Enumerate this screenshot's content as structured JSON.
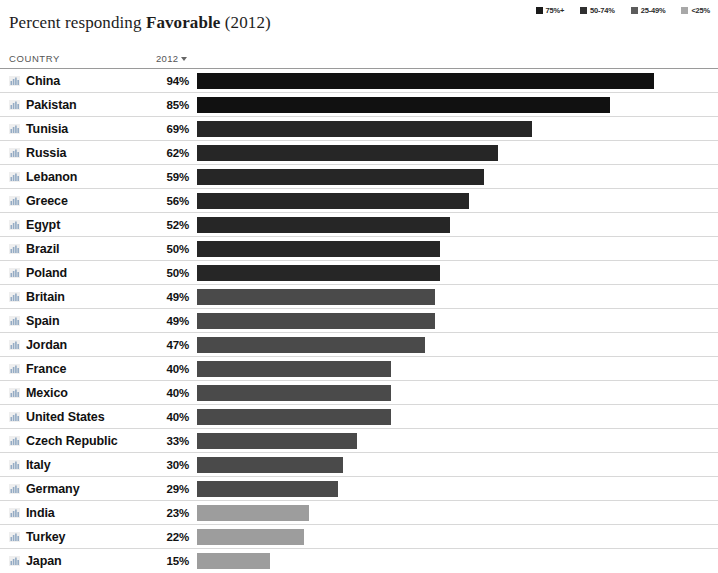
{
  "title": {
    "prefix": "Percent responding ",
    "strong": "Favorable",
    "suffix": " (2012)"
  },
  "legend": {
    "items": [
      {
        "label": "75%+",
        "color": "#1a1a1a",
        "icon": "legend-swatch-75-plus"
      },
      {
        "label": "50-74%",
        "color": "#303030",
        "icon": "legend-swatch-50-74"
      },
      {
        "label": "25-49%",
        "color": "#5c5c5c",
        "icon": "legend-swatch-25-49"
      },
      {
        "label": "<25%",
        "color": "#a8a8a8",
        "icon": "legend-swatch-under-25"
      }
    ]
  },
  "table": {
    "headers": {
      "country": "COUNTRY",
      "year": "2012",
      "sort_indicator": "descending"
    },
    "rows": [
      {
        "country": "China",
        "value": "94%",
        "pct": 94,
        "color": "#111111"
      },
      {
        "country": "Pakistan",
        "value": "85%",
        "pct": 85,
        "color": "#111111"
      },
      {
        "country": "Tunisia",
        "value": "69%",
        "pct": 69,
        "color": "#262626"
      },
      {
        "country": "Russia",
        "value": "62%",
        "pct": 62,
        "color": "#262626"
      },
      {
        "country": "Lebanon",
        "value": "59%",
        "pct": 59,
        "color": "#262626"
      },
      {
        "country": "Greece",
        "value": "56%",
        "pct": 56,
        "color": "#262626"
      },
      {
        "country": "Egypt",
        "value": "52%",
        "pct": 52,
        "color": "#262626"
      },
      {
        "country": "Brazil",
        "value": "50%",
        "pct": 50,
        "color": "#262626"
      },
      {
        "country": "Poland",
        "value": "50%",
        "pct": 50,
        "color": "#262626"
      },
      {
        "country": "Britain",
        "value": "49%",
        "pct": 49,
        "color": "#4a4a4a"
      },
      {
        "country": "Spain",
        "value": "49%",
        "pct": 49,
        "color": "#4a4a4a"
      },
      {
        "country": "Jordan",
        "value": "47%",
        "pct": 47,
        "color": "#4a4a4a"
      },
      {
        "country": "France",
        "value": "40%",
        "pct": 40,
        "color": "#4a4a4a"
      },
      {
        "country": "Mexico",
        "value": "40%",
        "pct": 40,
        "color": "#4a4a4a"
      },
      {
        "country": "United States",
        "value": "40%",
        "pct": 40,
        "color": "#4a4a4a"
      },
      {
        "country": "Czech Republic",
        "value": "33%",
        "pct": 33,
        "color": "#4a4a4a"
      },
      {
        "country": "Italy",
        "value": "30%",
        "pct": 30,
        "color": "#4a4a4a"
      },
      {
        "country": "Germany",
        "value": "29%",
        "pct": 29,
        "color": "#4a4a4a"
      },
      {
        "country": "India",
        "value": "23%",
        "pct": 23,
        "color": "#9d9d9d"
      },
      {
        "country": "Turkey",
        "value": "22%",
        "pct": 22,
        "color": "#9d9d9d"
      },
      {
        "country": "Japan",
        "value": "15%",
        "pct": 15,
        "color": "#9d9d9d"
      }
    ]
  },
  "chart_data": {
    "type": "bar",
    "title": "Percent responding Favorable (2012)",
    "xlabel": "",
    "ylabel": "Country",
    "xlim": [
      0,
      100
    ],
    "grid": false,
    "legend_position": "top-right",
    "orientation": "horizontal",
    "categories": [
      "China",
      "Pakistan",
      "Tunisia",
      "Russia",
      "Lebanon",
      "Greece",
      "Egypt",
      "Brazil",
      "Poland",
      "Britain",
      "Spain",
      "Jordan",
      "France",
      "Mexico",
      "United States",
      "Czech Republic",
      "Italy",
      "Germany",
      "India",
      "Turkey",
      "Japan"
    ],
    "values": [
      94,
      85,
      69,
      62,
      59,
      56,
      52,
      50,
      50,
      49,
      49,
      47,
      40,
      40,
      40,
      33,
      30,
      29,
      23,
      22,
      15
    ],
    "legend_entries": [
      "75%+",
      "50-74%",
      "25-49%",
      "<25%"
    ]
  }
}
